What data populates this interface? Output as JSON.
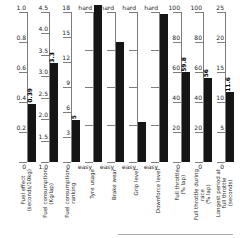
{
  "colors": {
    "bar": "#151515",
    "axis_line": "#7d7d7d",
    "tick_label": "#1c1c1c",
    "value_label": "#000000",
    "divider": "#aaaaaa",
    "background": "#ffffff"
  },
  "chart_data": {
    "type": "bar",
    "title": "",
    "orientation": "vertical-multi-axis",
    "layout": {
      "axis_top_px": 12,
      "axis_bottom_px": 162,
      "first_axis_x_px": 27,
      "axis_spacing_px": 22,
      "bar_width_px": 8,
      "tick_length_px": 8,
      "grid": false,
      "legend": false
    },
    "axes": [
      {
        "id": "fuel-effect",
        "title_lines": [
          "Fuel effect",
          "(seconds/10kg)"
        ],
        "scale_min": 0,
        "scale_max": 1.0,
        "value": 0.39,
        "value_label": "0.39",
        "value_frac": 0.39,
        "ticks": [
          {
            "label": "1.0",
            "frac": 1
          },
          {
            "label": "0.8",
            "frac": 0.8
          },
          {
            "label": "0.6",
            "frac": 0.6
          },
          {
            "label": "0.4",
            "frac": 0.4
          },
          {
            "label": "0.2",
            "frac": 0.2
          },
          {
            "label": "0",
            "frac": 0
          }
        ]
      },
      {
        "id": "fuel-consumption",
        "title_lines": [
          "Fuel consumption",
          "(Kg/lap)"
        ],
        "scale_min": 1.0,
        "scale_max": 4.5,
        "value": 3.3,
        "value_label": "3.3",
        "value_frac": 0.657,
        "ticks": [
          {
            "label": "4.5",
            "frac": 1
          },
          {
            "label": "4.0",
            "frac": 0.857
          },
          {
            "label": "3.5",
            "frac": 0.714
          },
          {
            "label": "3.0",
            "frac": 0.571
          },
          {
            "label": "2.5",
            "frac": 0.429
          },
          {
            "label": "2.0",
            "frac": 0.286
          },
          {
            "label": "1.5",
            "frac": 0.143
          },
          {
            "label": "1.0",
            "frac": 0
          }
        ]
      },
      {
        "id": "fuel-consumption-ranking",
        "title_lines": [
          "Fuel consumption",
          "ranking"
        ],
        "scale_min": 0,
        "scale_max": 18,
        "value": 5,
        "value_label": "5",
        "value_frac": 0.278,
        "ticks": [
          {
            "label": "18",
            "frac": 1
          },
          {
            "label": "15",
            "frac": 0.833
          },
          {
            "label": "12",
            "frac": 0.667
          },
          {
            "label": "9",
            "frac": 0.5
          },
          {
            "label": "6",
            "frac": 0.333
          },
          {
            "label": "3",
            "frac": 0.167
          },
          {
            "label": "0",
            "frac": 0
          }
        ]
      },
      {
        "id": "tyre-usage",
        "title_lines": [
          "Tyre usage"
        ],
        "scale_min": "easy",
        "scale_max": "hard",
        "value": "hard",
        "value_label": "",
        "value_frac": 1.05,
        "ticks": [
          {
            "label": "hard",
            "frac": 1
          },
          {
            "label": "",
            "frac": 0.75
          },
          {
            "label": "",
            "frac": 0.5
          },
          {
            "label": "",
            "frac": 0.25
          },
          {
            "label": "easy",
            "frac": 0
          }
        ]
      },
      {
        "id": "brake-wear",
        "title_lines": [
          "Brake wear"
        ],
        "scale_min": "easy",
        "scale_max": "hard",
        "value": 0.8,
        "value_label": "",
        "value_frac": 0.8,
        "ticks": [
          {
            "label": "hard",
            "frac": 1
          },
          {
            "label": "",
            "frac": 0.75
          },
          {
            "label": "",
            "frac": 0.5
          },
          {
            "label": "",
            "frac": 0.25
          },
          {
            "label": "easy",
            "frac": 0
          }
        ]
      },
      {
        "id": "grip-level",
        "title_lines": [
          "Grip level"
        ],
        "scale_min": "easy",
        "scale_max": "hard",
        "value": 0.27,
        "value_label": "",
        "value_frac": 0.27,
        "ticks": [
          {
            "label": "hard",
            "frac": 1
          },
          {
            "label": "",
            "frac": 0.75
          },
          {
            "label": "",
            "frac": 0.5
          },
          {
            "label": "",
            "frac": 0.25
          },
          {
            "label": "easy",
            "frac": 0
          }
        ]
      },
      {
        "id": "downforce-level",
        "title_lines": [
          "Downforce level"
        ],
        "scale_min": "easy",
        "scale_max": "hard",
        "value": 0.99,
        "value_label": "",
        "value_frac": 0.99,
        "ticks": [
          {
            "label": "hard",
            "frac": 1
          },
          {
            "label": "",
            "frac": 0.75
          },
          {
            "label": "",
            "frac": 0.5
          },
          {
            "label": "",
            "frac": 0.25
          },
          {
            "label": "easy",
            "frac": 0
          }
        ]
      },
      {
        "id": "full-throttle",
        "title_lines": [
          "Full throttle",
          "(% lap)"
        ],
        "scale_min": 0,
        "scale_max": 100,
        "value": 59.8,
        "value_label": "59.8",
        "value_frac": 0.598,
        "ticks": [
          {
            "label": "100",
            "frac": 1
          },
          {
            "label": "80",
            "frac": 0.8
          },
          {
            "label": "60",
            "frac": 0.6
          },
          {
            "label": "40",
            "frac": 0.4
          },
          {
            "label": "20",
            "frac": 0.2
          },
          {
            "label": "0",
            "frac": 0
          }
        ]
      },
      {
        "id": "full-throttle-during-race",
        "title_lines": [
          "Full throttle during",
          "race",
          "(% lap)"
        ],
        "scale_min": 0,
        "scale_max": 100,
        "value": 56,
        "value_label": "56",
        "value_frac": 0.56,
        "ticks": [
          {
            "label": "100",
            "frac": 1
          },
          {
            "label": "80",
            "frac": 0.8
          },
          {
            "label": "60",
            "frac": 0.6
          },
          {
            "label": "40",
            "frac": 0.4
          },
          {
            "label": "20",
            "frac": 0.2
          },
          {
            "label": "0",
            "frac": 0
          }
        ]
      },
      {
        "id": "longest-period-full-throttle",
        "title_lines": [
          "Longest period at",
          "full throttle",
          "(seconds)"
        ],
        "scale_min": 0,
        "scale_max": 25,
        "value": 11.6,
        "value_label": "11.6",
        "value_frac": 0.464,
        "ticks": [
          {
            "label": "25",
            "frac": 1
          },
          {
            "label": "20",
            "frac": 0.8
          },
          {
            "label": "15",
            "frac": 0.6
          },
          {
            "label": "10",
            "frac": 0.4
          },
          {
            "label": "5",
            "frac": 0.2
          },
          {
            "label": "0",
            "frac": 0
          }
        ]
      }
    ]
  }
}
